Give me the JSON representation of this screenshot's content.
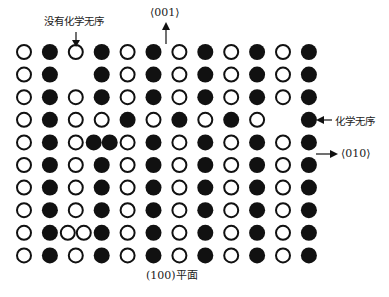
{
  "title": "",
  "labels": {
    "no_chemical_disorder": "没有化学无序",
    "direction_001": "⟨001⟩",
    "chemical_disorder": "化学无序",
    "direction_010": "⟨010⟩",
    "plane_100": "(100)平面"
  },
  "legend": {
    "open_atom": "open-circle",
    "filled_atom": "filled-circle"
  },
  "lattice": {
    "rows": [
      "O F O F O F O F O F O F",
      "O F _ F O F O F O F O F",
      "O F O F O F O F O F O F",
      "O F O O F O F O F O _ F",
      "O F O FF O F O F O F O F",
      "O F O F O F O F O F O F",
      "O F O F O F O F O F O F",
      "O F O F O F O F O F O F",
      "O F OO F O F O F O F O F",
      "O F O F O F O F O F O F"
    ],
    "key": {
      "O": "open atom",
      "F": "filled atom",
      "_": "vacancy",
      "FF": "two filled atoms in one site",
      "OO": "two open atoms in one site"
    }
  }
}
